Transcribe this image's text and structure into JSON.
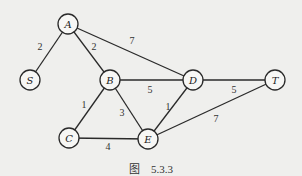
{
  "diagram": {
    "type": "weighted-undirected-graph",
    "nodes": [
      {
        "id": "A",
        "label": "A",
        "x": 68,
        "y": 24
      },
      {
        "id": "S",
        "label": "S",
        "x": 30,
        "y": 80
      },
      {
        "id": "B",
        "label": "B",
        "x": 110,
        "y": 80
      },
      {
        "id": "D",
        "label": "D",
        "x": 193,
        "y": 80
      },
      {
        "id": "T",
        "label": "T",
        "x": 275,
        "y": 80
      },
      {
        "id": "C",
        "label": "C",
        "x": 69,
        "y": 138
      },
      {
        "id": "E",
        "label": "E",
        "x": 148,
        "y": 139
      }
    ],
    "edges": [
      {
        "from": "A",
        "to": "S",
        "weight": "2",
        "lx": 40,
        "ly": 50
      },
      {
        "from": "A",
        "to": "B",
        "weight": "2",
        "lx": 94,
        "ly": 50
      },
      {
        "from": "A",
        "to": "D",
        "weight": "7",
        "lx": 132,
        "ly": 44
      },
      {
        "from": "B",
        "to": "D",
        "weight": "5",
        "lx": 150,
        "ly": 93
      },
      {
        "from": "B",
        "to": "C",
        "weight": "1",
        "lx": 84,
        "ly": 108
      },
      {
        "from": "B",
        "to": "E",
        "weight": "3",
        "lx": 122,
        "ly": 116
      },
      {
        "from": "C",
        "to": "E",
        "weight": "4",
        "lx": 108,
        "ly": 150
      },
      {
        "from": "D",
        "to": "E",
        "weight": "1",
        "lx": 168,
        "ly": 110
      },
      {
        "from": "D",
        "to": "T",
        "weight": "5",
        "lx": 234,
        "ly": 93
      },
      {
        "from": "E",
        "to": "T",
        "weight": "7",
        "lx": 216,
        "ly": 122
      }
    ],
    "node_radius": 10
  },
  "caption": {
    "prefix": "图",
    "number": "5.3.3"
  }
}
